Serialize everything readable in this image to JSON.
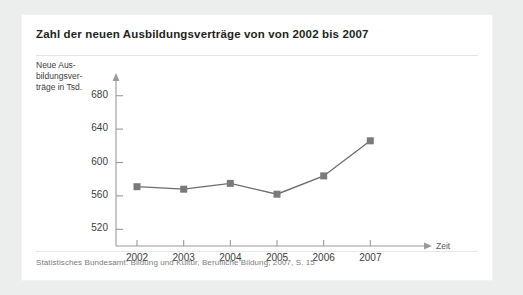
{
  "card": {
    "title": "Zahl der neuen Ausbildungsverträge von von 2002 bis 2007",
    "source_note": "Statistisches Bundesamt: Bildung und Kultur, Berufliche Bildung, 2007, S. 15"
  },
  "colors": {
    "page_background": "#eceded",
    "card_background": "#ffffff",
    "title_text": "#231f20",
    "axis": "#9a9a9a",
    "series_line": "#6b6b6b",
    "series_marker": "#7a7a7a",
    "source_text": "#7b7b7b"
  },
  "axis_caption": {
    "y_line1": "Neue Aus-",
    "y_line2": "bildungsver-",
    "y_line3": "träge in Tsd.",
    "x": "Zeit"
  },
  "chart_data": {
    "type": "line",
    "title": "Zahl der neuen Ausbildungsverträge von von 2002 bis 2007",
    "xlabel": "Zeit",
    "ylabel": "Neue Ausbildungsverträge in Tsd.",
    "categories": [
      "2002",
      "2003",
      "2004",
      "2005",
      "2006",
      "2007"
    ],
    "values": [
      571,
      568,
      575,
      562,
      584,
      626
    ],
    "ylim": [
      500,
      700
    ],
    "yticks": [
      520,
      560,
      600,
      640,
      680
    ],
    "ytick_labels": [
      "520",
      "560",
      "600",
      "640",
      "680"
    ],
    "xtick_labels": [
      "2002",
      "2003",
      "2004",
      "2005",
      "2006",
      "2007"
    ],
    "grid": false,
    "legend": false,
    "marker": "square",
    "series": [
      {
        "name": "Neue Ausbildungsverträge",
        "values": [
          571,
          568,
          575,
          562,
          584,
          626
        ]
      }
    ]
  }
}
